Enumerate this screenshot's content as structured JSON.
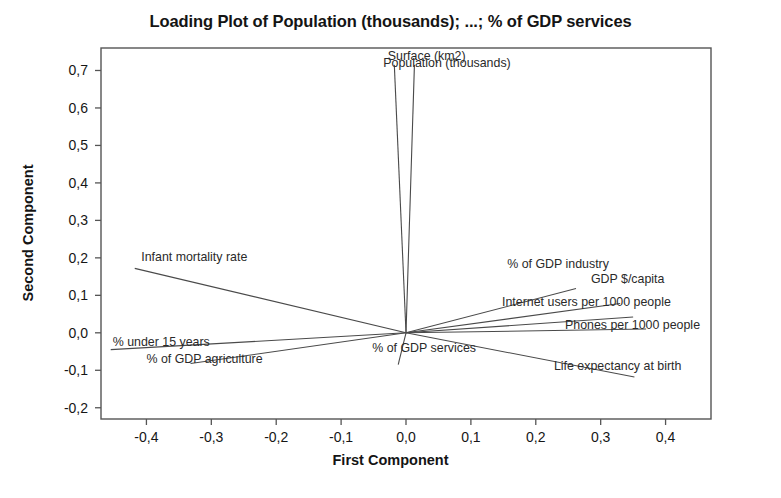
{
  "chart_data": {
    "type": "scatter",
    "title": "Loading Plot of Population (thousands); ...; % of GDP services",
    "xlabel": "First Component",
    "ylabel": "Second Component",
    "xlim": [
      -0.47,
      0.47
    ],
    "ylim": [
      -0.23,
      0.76
    ],
    "grid": false,
    "legend": "none",
    "decimal_separator": ",",
    "xticks": [
      "-0,4",
      "-0,3",
      "-0,2",
      "-0,1",
      "0,0",
      "0,1",
      "0,2",
      "0,3",
      "0,4"
    ],
    "xtick_values": [
      -0.4,
      -0.3,
      -0.2,
      -0.1,
      0.0,
      0.1,
      0.2,
      0.3,
      0.4
    ],
    "yticks": [
      "0,7",
      "0,6",
      "0,5",
      "0,4",
      "0,3",
      "0,2",
      "0,1",
      "0,0",
      "-0,1",
      "-0,2"
    ],
    "ytick_values": [
      0.7,
      0.6,
      0.5,
      0.4,
      0.3,
      0.2,
      0.1,
      0.0,
      -0.1,
      -0.2
    ],
    "origin": [
      0.0,
      0.0
    ],
    "loadings": [
      {
        "name": "Surface (km2)",
        "x": -0.018,
        "y": 0.715,
        "label_x": -0.028,
        "label_y": 0.735
      },
      {
        "name": "Population (thousands)",
        "x": 0.013,
        "y": 0.715,
        "label_x": -0.035,
        "label_y": 0.718
      },
      {
        "name": "Infant mortality rate",
        "x": -0.418,
        "y": 0.172,
        "label_x": -0.408,
        "label_y": 0.2
      },
      {
        "name": "% under 15 years",
        "x": -0.455,
        "y": -0.045,
        "label_x": -0.452,
        "label_y": -0.027
      },
      {
        "name": "% of GDP agriculture",
        "x": -0.332,
        "y": -0.082,
        "label_x": -0.4,
        "label_y": -0.073
      },
      {
        "name": "% of GDP services",
        "x": -0.012,
        "y": -0.085,
        "label_x": -0.052,
        "label_y": -0.043
      },
      {
        "name": "% of GDP industry",
        "x": 0.262,
        "y": 0.118,
        "label_x": 0.156,
        "label_y": 0.182
      },
      {
        "name": "GDP $/capita",
        "x": 0.33,
        "y": 0.078,
        "label_x": 0.285,
        "label_y": 0.14
      },
      {
        "name": "Internet users per 1000 people",
        "x": 0.35,
        "y": 0.042,
        "label_x": 0.148,
        "label_y": 0.08
      },
      {
        "name": "Phones per 1000 people",
        "x": 0.37,
        "y": 0.01,
        "label_x": 0.245,
        "label_y": 0.018
      },
      {
        "name": "Life expectancy at birth",
        "x": 0.352,
        "y": -0.118,
        "label_x": 0.228,
        "label_y": -0.092
      }
    ]
  }
}
